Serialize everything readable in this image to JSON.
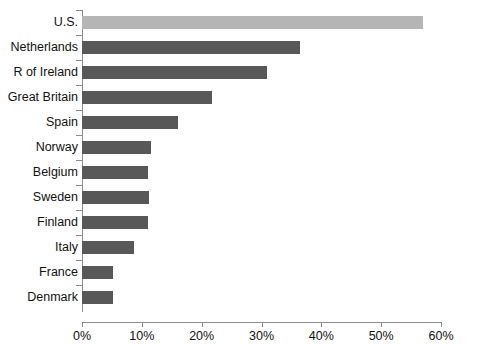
{
  "chart_data": {
    "type": "bar",
    "orientation": "horizontal",
    "title": "",
    "xlabel": "",
    "ylabel": "",
    "xlim": [
      0,
      60
    ],
    "xticks": [
      0,
      10,
      20,
      30,
      40,
      50,
      60
    ],
    "xtick_labels": [
      "0%",
      "10%",
      "20%",
      "30%",
      "40%",
      "50%",
      "60%"
    ],
    "grid": false,
    "legend": "none",
    "categories": [
      "U.S.",
      "Netherlands",
      "R of Ireland",
      "Great Britain",
      "Spain",
      "Norway",
      "Belgium",
      "Sweden",
      "Finland",
      "Italy",
      "France",
      "Denmark"
    ],
    "values": [
      57,
      36.5,
      31,
      21.8,
      16,
      11.5,
      11,
      11.2,
      11,
      8.7,
      5.2,
      5.2
    ],
    "value_labels": [
      "57%",
      "36.5%",
      "31%",
      "21.8%",
      "16%",
      "11.5%",
      "11%",
      "11.2%",
      "11%",
      "8.7%",
      "5.2%",
      "5.2%"
    ],
    "bar_colors": [
      "#b5b5b5",
      "#585858",
      "#585858",
      "#585858",
      "#585858",
      "#585858",
      "#585858",
      "#585858",
      "#585858",
      "#585858",
      "#585858",
      "#585858"
    ],
    "highlight_color": "#b5b5b5",
    "series_color": "#585858",
    "axis_color": "#8c8c8c"
  }
}
